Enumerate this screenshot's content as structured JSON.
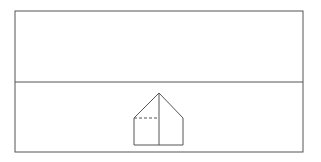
{
  "diagram": {
    "type": "line-drawing",
    "stroke_color": "#555555",
    "background_color": "#ffffff",
    "frame": {
      "x": 15,
      "y": 11,
      "width": 288,
      "height": 141
    },
    "horizon_line": {
      "x1": 15,
      "y1": 82,
      "x2": 303,
      "y2": 82
    },
    "house": {
      "outline_points": "134,145 134,118 159,93 183,118 183,145 134,145",
      "center_line": {
        "x1": 159,
        "y1": 93,
        "x2": 159,
        "y2": 145
      },
      "dashed_line": {
        "x1": 134,
        "y1": 118,
        "x2": 159,
        "y2": 118
      }
    }
  }
}
